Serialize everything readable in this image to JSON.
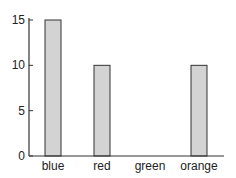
{
  "chart_data": {
    "type": "bar",
    "title": "",
    "xlabel": "",
    "ylabel": "",
    "categories": [
      "blue",
      "red",
      "green",
      "orange"
    ],
    "values": [
      15,
      10,
      0,
      10
    ],
    "ylim": [
      0,
      15
    ],
    "yticks": [
      0,
      5,
      10,
      15
    ],
    "grid": false,
    "bar_color": "#d3d3d3",
    "edge_color": "#333333"
  }
}
